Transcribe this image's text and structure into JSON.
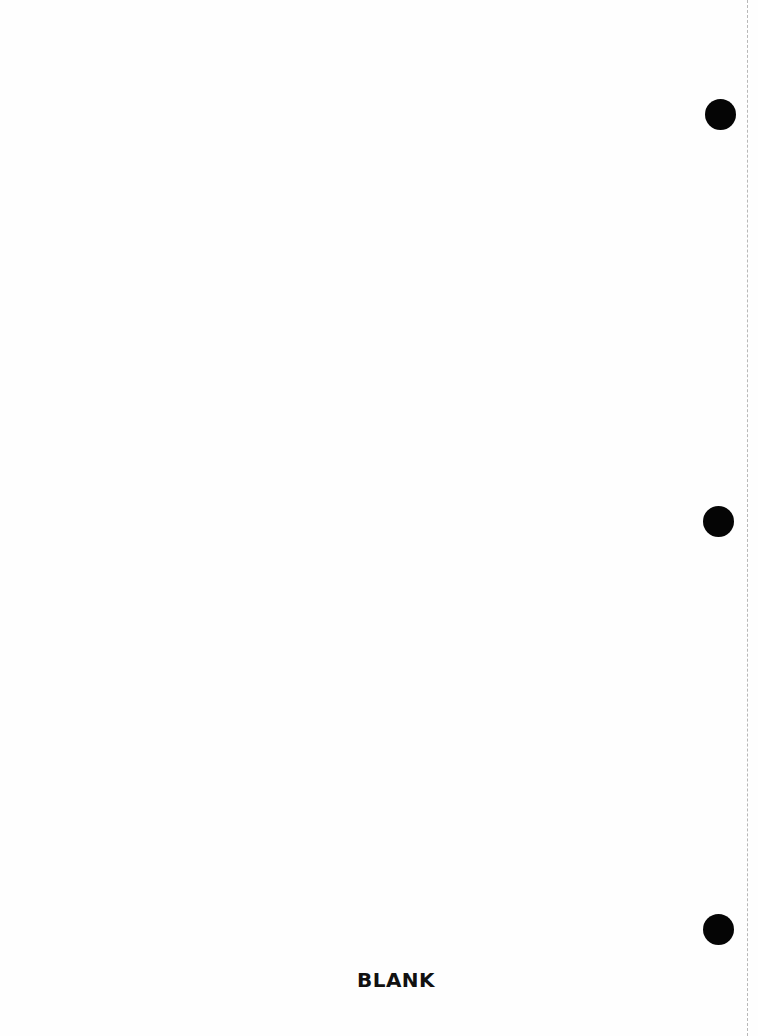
{
  "document": {
    "page_label": "BLANK",
    "hole_punches": [
      {
        "x": 721,
        "y": 115
      },
      {
        "x": 719,
        "y": 522
      },
      {
        "x": 719,
        "y": 930
      }
    ],
    "colors": {
      "paper": "#fefefe",
      "hole": "#050505",
      "text": "#111111",
      "perforation": "#b8b8b8"
    }
  }
}
